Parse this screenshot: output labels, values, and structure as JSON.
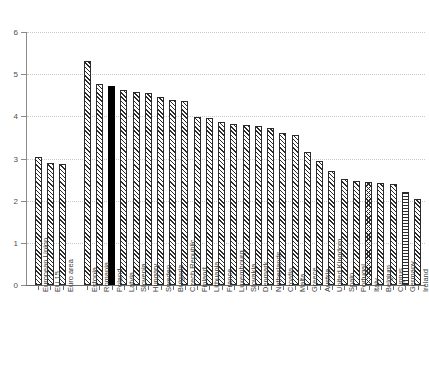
{
  "chart_data": {
    "type": "bar",
    "title": "",
    "subtitle": "",
    "xlabel": "",
    "ylabel": "",
    "ylim": [
      0,
      6
    ],
    "ytick_labels": [
      "0",
      "1",
      "2",
      "3",
      "4",
      "5",
      "6"
    ],
    "ytick_values": [
      0,
      1,
      2,
      3,
      4,
      5,
      6
    ],
    "grid": true,
    "grid_axis": "y",
    "grid_style": "dotted",
    "legend": "none",
    "highlight_category": "Poland",
    "categories": [
      "European Union",
      "EU 15",
      "Euro area",
      "Estonia",
      "Romania",
      "Poland",
      "Latvia",
      "Slovenia",
      "Hungary",
      "Sweden",
      "Bulgaria",
      "Czech Republic",
      "Finland",
      "Lithuania",
      "France",
      "Luxembourg",
      "Slovakia",
      "Denmark",
      "Netherlands",
      "Croatia",
      "Malta",
      "Greece",
      "Austria",
      "United Kingdom",
      "Spain",
      "Portugal",
      "Italy",
      "Belgium",
      "Cyprus",
      "Germany",
      "Ireland"
    ],
    "values": [
      3.04,
      2.89,
      2.86,
      5.32,
      4.76,
      4.71,
      4.62,
      4.58,
      4.55,
      4.46,
      4.39,
      4.37,
      3.99,
      3.96,
      3.86,
      3.83,
      3.8,
      3.76,
      3.73,
      3.6,
      3.56,
      3.16,
      2.93,
      2.7,
      2.52,
      2.47,
      2.45,
      2.43,
      2.4,
      2.2,
      2.05
    ],
    "bar_patterns": [
      "diagonal-hatch",
      "diagonal-hatch",
      "diagonal-hatch",
      "diagonal-hatch",
      "diagonal-hatch",
      "solid-black",
      "diagonal-hatch",
      "diagonal-hatch",
      "diagonal-hatch",
      "diagonal-hatch",
      "diagonal-hatch",
      "diagonal-hatch",
      "diagonal-hatch",
      "diagonal-hatch",
      "diagonal-hatch",
      "diagonal-hatch",
      "diagonal-hatch",
      "diagonal-hatch",
      "diagonal-hatch",
      "diagonal-hatch",
      "diagonal-hatch",
      "diagonal-hatch",
      "diagonal-hatch",
      "diagonal-hatch",
      "diagonal-hatch",
      "diagonal-hatch",
      "cross-hatch",
      "diagonal-hatch",
      "diagonal-hatch",
      "horizontal-hatch",
      "diagonal-hatch"
    ],
    "group_gap_after_index": 2,
    "colors": {
      "bar_outline": "#2b2b2b",
      "bar_fill": "#ffffff",
      "highlight": "#000000",
      "gridline": "#c9c9c9",
      "axis": "#6f6f6f",
      "tick_label": "#4d4d4d",
      "category_label": "#3d3d3d",
      "background": "#ffffff"
    }
  }
}
